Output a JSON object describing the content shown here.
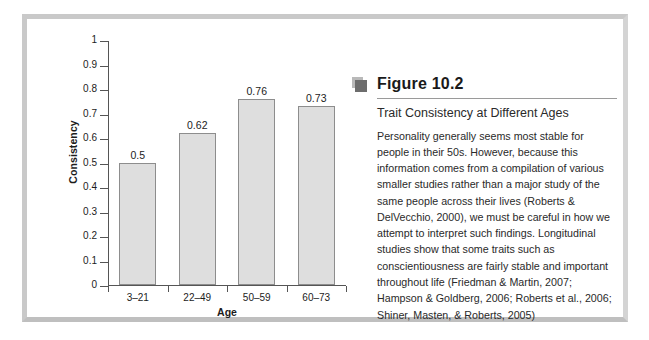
{
  "figure": {
    "icon_name": "figure-marker-icon",
    "number_label": "Figure 10.2",
    "subtitle": "Trait Consistency at Different Ages",
    "body": "Personality generally seems most stable for people in their 50s. However, because this information comes from a compilation of various smaller studies rather than a major study of the same people across their lives (Roberts & DelVecchio, 2000), we must be careful in how we attempt to interpret such findings. Longitudinal studies show that some traits such as conscientiousness are fairly stable and important throughout life (Friedman & Martin, 2007; Hampson & Goldberg, 2006; Roberts et al., 2006; Shiner, Masten, & Roberts, 2005)"
  },
  "colors": {
    "bar_fill": "#dedede",
    "bar_stroke": "#8d8d8d",
    "axis": "#555555",
    "frame": "#c9c9c9",
    "text": "#1c1c1c"
  },
  "chart_data": {
    "type": "bar",
    "title": "",
    "categories": [
      "3–21",
      "22–49",
      "50–59",
      "60–73"
    ],
    "values": [
      0.5,
      0.62,
      0.76,
      0.73
    ],
    "value_labels": [
      "0.5",
      "0.62",
      "0.76",
      "0.73"
    ],
    "xlabel": "Age",
    "ylabel": "Consistency",
    "ylim": [
      0,
      1
    ],
    "ytick_labels": [
      "0",
      "0.1",
      "0.2",
      "0.3",
      "0.4",
      "0.5",
      "0.6",
      "0.7",
      "0.8",
      "0.9",
      "1"
    ],
    "ytick_values": [
      0,
      0.1,
      0.2,
      0.3,
      0.4,
      0.5,
      0.6,
      0.7,
      0.8,
      0.9,
      1
    ],
    "grid": false,
    "legend": null
  }
}
